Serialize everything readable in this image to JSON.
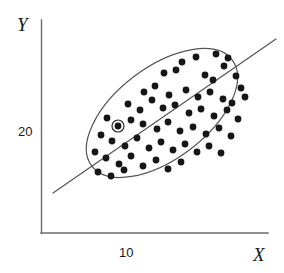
{
  "chart_data": {
    "type": "scatter",
    "title": "",
    "subtitle": "",
    "xlabel": "X",
    "ylabel": "Y",
    "xticks": [
      "10"
    ],
    "yticks": [
      "20"
    ],
    "xtick_values": [
      10
    ],
    "ytick_values": [
      20
    ],
    "grid": false,
    "legend": null,
    "annotations": [
      {
        "name": "highlighted-point",
        "kind": "circled-marker",
        "x": 8.5,
        "y": 20.4,
        "px": 118,
        "py": 126,
        "ring_radius_px": 6
      }
    ],
    "overlays": [
      {
        "name": "concentration-ellipse",
        "kind": "ellipse",
        "center_px": [
          162,
          113
        ],
        "rx_px": 88,
        "ry_px": 46,
        "rotation_deg": -37
      },
      {
        "name": "regression-line",
        "kind": "line",
        "x1_px": 53,
        "y1_px": 193,
        "x2_px": 276,
        "y2_px": 39,
        "slope_px": -0.69
      }
    ],
    "axes": {
      "x_axis_px": {
        "x1": 41,
        "y1": 233,
        "x2": 268,
        "y2": 233
      },
      "y_axis_px": {
        "x1": 41,
        "y1": 20,
        "x2": 41,
        "y2": 233
      },
      "xtick_px": [
        128
      ],
      "ytick_px": [
        131
      ]
    },
    "series": [
      {
        "name": "observations",
        "marker": "filled-circle",
        "marker_radius_px": 3.4,
        "color": "#161616",
        "n_points": 63,
        "points_px": [
          [
            182,
            62
          ],
          [
            196,
            57
          ],
          [
            216,
            54
          ],
          [
            224,
            66
          ],
          [
            228,
            58
          ],
          [
            164,
            73
          ],
          [
            176,
            70
          ],
          [
            205,
            75
          ],
          [
            213,
            80
          ],
          [
            236,
            76
          ],
          [
            241,
            88
          ],
          [
            144,
            92
          ],
          [
            155,
            86
          ],
          [
            169,
            95
          ],
          [
            186,
            90
          ],
          [
            198,
            97
          ],
          [
            210,
            92
          ],
          [
            223,
            99
          ],
          [
            232,
            103
          ],
          [
            245,
            97
          ],
          [
            128,
            104
          ],
          [
            140,
            110
          ],
          [
            152,
            100
          ],
          [
            163,
            108
          ],
          [
            175,
            105
          ],
          [
            189,
            113
          ],
          [
            201,
            109
          ],
          [
            214,
            116
          ],
          [
            227,
            110
          ],
          [
            238,
            119
          ],
          [
            107,
            118
          ],
          [
            118,
            126
          ],
          [
            131,
            120
          ],
          [
            143,
            124
          ],
          [
            157,
            129
          ],
          [
            168,
            122
          ],
          [
            180,
            131
          ],
          [
            193,
            127
          ],
          [
            206,
            134
          ],
          [
            219,
            128
          ],
          [
            231,
            136
          ],
          [
            101,
            135
          ],
          [
            112,
            141
          ],
          [
            125,
            146
          ],
          [
            137,
            138
          ],
          [
            149,
            148
          ],
          [
            161,
            142
          ],
          [
            173,
            150
          ],
          [
            185,
            144
          ],
          [
            197,
            152
          ],
          [
            209,
            146
          ],
          [
            221,
            153
          ],
          [
            95,
            152
          ],
          [
            106,
            158
          ],
          [
            119,
            164
          ],
          [
            131,
            156
          ],
          [
            143,
            166
          ],
          [
            156,
            160
          ],
          [
            168,
            169
          ],
          [
            181,
            162
          ],
          [
            98,
            172
          ],
          [
            111,
            176
          ],
          [
            124,
            170
          ]
        ]
      }
    ],
    "colors": {
      "axis": "#6b6b6b",
      "point": "#161616",
      "ellipse": "#555555",
      "line": "#555555",
      "text": "#1a1a1a",
      "background": "#ffffff"
    }
  }
}
